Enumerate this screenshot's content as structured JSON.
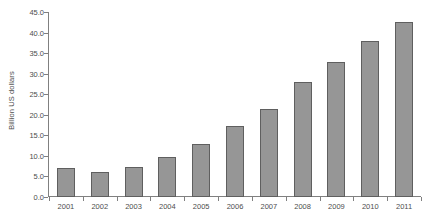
{
  "chart_data": {
    "type": "bar",
    "title": "",
    "subtitle": "",
    "xlabel": "",
    "ylabel": "Billion US dollars",
    "categories": [
      "2001",
      "2002",
      "2003",
      "2004",
      "2005",
      "2006",
      "2007",
      "2008",
      "2009",
      "2010",
      "2011"
    ],
    "values": [
      7.1,
      6.1,
      7.3,
      9.8,
      12.8,
      17.2,
      21.5,
      27.9,
      32.9,
      37.9,
      42.6
    ],
    "ylim": [
      0.0,
      45.0
    ],
    "ytick_step": 5.0,
    "ytick_labels": [
      "45.0",
      "40.0",
      "35.0",
      "30.0",
      "25.0",
      "20.0",
      "15.0",
      "10.0",
      "5.0",
      "0.0"
    ],
    "ytick_values": [
      45.0,
      40.0,
      35.0,
      30.0,
      25.0,
      20.0,
      15.0,
      10.0,
      5.0,
      0.0
    ],
    "grid": false,
    "legend": null,
    "legend_position": "none",
    "data_labels": false,
    "colors": {
      "bar_fill": "#969696",
      "bar_outline": "#5f5f5f",
      "axis": "#808080",
      "text": "#4d4d4d",
      "background": "#ffffff"
    }
  }
}
